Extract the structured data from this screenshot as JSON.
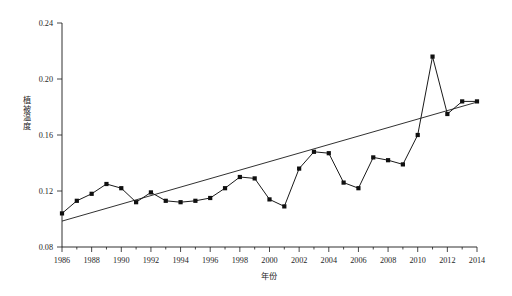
{
  "chart_data": {
    "type": "line",
    "title": "",
    "xlabel": "年份",
    "ylabel": "植被温度",
    "xlim": [
      1986,
      2014
    ],
    "ylim": [
      0.08,
      0.24
    ],
    "grid": false,
    "legend": "none",
    "xticks": [
      1986,
      1988,
      1990,
      1992,
      1994,
      1996,
      1998,
      2000,
      2002,
      2004,
      2006,
      2008,
      2010,
      2012,
      2014
    ],
    "xtick_labels": [
      "1986",
      "1988",
      "1990",
      "1992",
      "1994",
      "1996",
      "1998",
      "2000",
      "2002",
      "2004",
      "2006",
      "2008",
      "2010",
      "2012",
      "2014"
    ],
    "yticks": [
      0.08,
      0.12,
      0.16,
      0.2,
      0.24
    ],
    "ytick_labels": [
      "0.08",
      "0.12",
      "0.16",
      "0.20",
      "0.24"
    ],
    "x": [
      1986,
      1987,
      1988,
      1989,
      1990,
      1991,
      1992,
      1993,
      1994,
      1995,
      1996,
      1997,
      1998,
      1999,
      2000,
      2001,
      2002,
      2003,
      2004,
      2005,
      2006,
      2007,
      2008,
      2009,
      2010,
      2011,
      2012,
      2013,
      2014
    ],
    "series": [
      {
        "name": "植被温度",
        "type": "line",
        "marker": "square",
        "color": "#101010",
        "values": [
          0.104,
          0.113,
          0.118,
          0.125,
          0.122,
          0.112,
          0.119,
          0.113,
          0.112,
          0.113,
          0.115,
          0.122,
          0.13,
          0.129,
          0.114,
          0.109,
          0.136,
          0.148,
          0.147,
          0.126,
          0.122,
          0.144,
          0.142,
          0.139,
          0.16,
          0.216,
          0.175,
          0.184,
          0.184
        ]
      },
      {
        "name": "趋势线",
        "type": "trend",
        "color": "#1a1a1a",
        "endpoints": [
          [
            1986,
            0.0985
          ],
          [
            2014,
            0.1835
          ]
        ]
      }
    ],
    "annotations": []
  },
  "axis_titles": {
    "x": "年份",
    "y_chars": [
      "植",
      "被",
      "温",
      "度"
    ]
  }
}
